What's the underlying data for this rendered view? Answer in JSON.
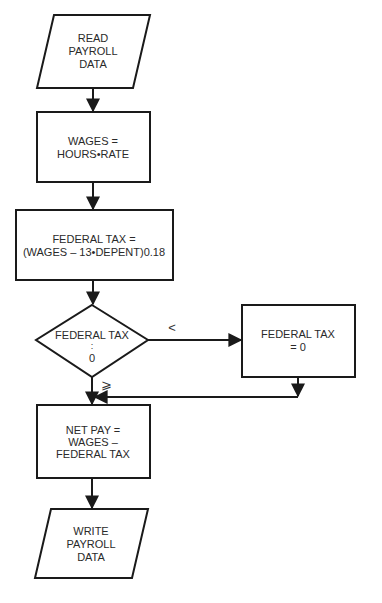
{
  "flowchart": {
    "nodes": [
      {
        "id": "read",
        "type": "io",
        "lines": [
          "READ",
          "PAYROLL",
          "DATA"
        ]
      },
      {
        "id": "wages",
        "type": "process",
        "lines": [
          "WAGES =",
          "HOURS•RATE"
        ]
      },
      {
        "id": "fedtax",
        "type": "process",
        "lines": [
          "FEDERAL TAX =",
          "(WAGES – 13•DEPENT)0.18"
        ]
      },
      {
        "id": "decision",
        "type": "decision",
        "lines": [
          "FEDERAL TAX",
          ":",
          "0"
        ]
      },
      {
        "id": "zero",
        "type": "process",
        "lines": [
          "FEDERAL TAX",
          "=  0"
        ]
      },
      {
        "id": "netpay",
        "type": "process",
        "lines": [
          "NET PAY  =",
          "WAGES –",
          "FEDERAL TAX"
        ]
      },
      {
        "id": "write",
        "type": "io",
        "lines": [
          "WRITE",
          "PAYROLL",
          "DATA"
        ]
      }
    ],
    "edges": [
      {
        "from": "read",
        "to": "wages",
        "label": ""
      },
      {
        "from": "wages",
        "to": "fedtax",
        "label": ""
      },
      {
        "from": "fedtax",
        "to": "decision",
        "label": ""
      },
      {
        "from": "decision",
        "to": "zero",
        "label": "<"
      },
      {
        "from": "decision",
        "to": "netpay",
        "label": "⩾"
      },
      {
        "from": "zero",
        "to": "netpay",
        "label": ""
      },
      {
        "from": "netpay",
        "to": "write",
        "label": ""
      }
    ]
  }
}
